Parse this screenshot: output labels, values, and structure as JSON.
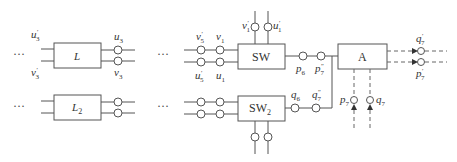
{
  "diagram": {
    "blocks": {
      "L": {
        "label": "L"
      },
      "L2": {
        "label": "L",
        "sub": "2"
      },
      "SW": {
        "label": "SW"
      },
      "SW2": {
        "label": "SW",
        "sub": "2"
      },
      "A": {
        "label": "A"
      }
    },
    "ellipsis": "···",
    "labels": {
      "u3p": {
        "base": "u",
        "sub": "3",
        "sup": "'"
      },
      "v3p": {
        "base": "v",
        "sub": "3",
        "sup": "'"
      },
      "u3": {
        "base": "u",
        "sub": "3"
      },
      "v3": {
        "base": "v",
        "sub": "3"
      },
      "v5p": {
        "base": "v",
        "sub": "5",
        "sup": "'"
      },
      "v1": {
        "base": "v",
        "sub": "1"
      },
      "u5p": {
        "base": "u",
        "sub": "5",
        "sup": "'"
      },
      "u1": {
        "base": "u",
        "sub": "1"
      },
      "v1p": {
        "base": "v",
        "sub": "1",
        "sup": "'"
      },
      "u1p": {
        "base": "u",
        "sub": "1",
        "sup": "'"
      },
      "p6": {
        "base": "p",
        "sub": "6"
      },
      "p7pp": {
        "base": "p",
        "sub": "7",
        "sup": "\""
      },
      "q6": {
        "base": "q",
        "sub": "6"
      },
      "q7pp": {
        "base": "q",
        "sub": "7",
        "sup": "\""
      },
      "p7": {
        "base": "p",
        "sub": "7"
      },
      "q7": {
        "base": "q",
        "sub": "7"
      },
      "q7p": {
        "base": "q",
        "sub": "7",
        "sup": "'"
      },
      "p7p": {
        "base": "p",
        "sub": "7",
        "sup": "'"
      }
    }
  }
}
